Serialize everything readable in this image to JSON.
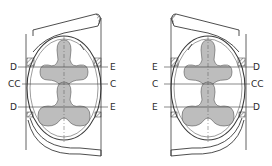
{
  "figure": {
    "left_pump": {
      "left_labels": [
        "D",
        "CC",
        "D"
      ],
      "right_labels": [
        "E",
        "C",
        "E"
      ]
    },
    "right_pump": {
      "left_labels": [
        "E",
        "C",
        "E"
      ],
      "right_labels": [
        "D",
        "CC",
        "D"
      ]
    },
    "colors": {
      "line": "#3a3a3a",
      "rotor_fill": "#bdbdbd",
      "background": "#ffffff"
    }
  }
}
